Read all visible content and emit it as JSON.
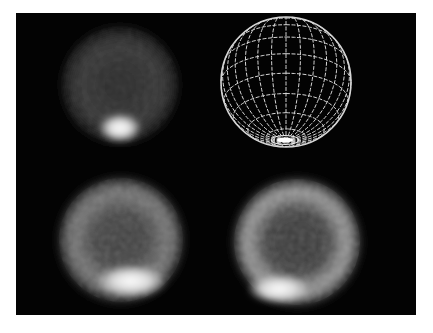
{
  "figure": {
    "background": "#ffffff",
    "panel_background": "#030303",
    "panels": [
      {
        "id": "top-left",
        "kind": "scintigraphic-sphere",
        "cx": 104,
        "cy": 72,
        "r": 58,
        "base_gray": "#3a3a3a",
        "hotspot": {
          "cx": 104,
          "cy": 115,
          "rx": 20,
          "ry": 14,
          "color": "#f4f4f4"
        }
      },
      {
        "id": "top-right",
        "kind": "wireframe-sphere",
        "cx": 270,
        "cy": 69,
        "r": 65,
        "meridians": 14,
        "parallels": 9,
        "line_color": "#d8d8d8",
        "pole_highlight": {
          "cx": 269,
          "cy": 127,
          "rx": 14,
          "ry": 4
        }
      },
      {
        "id": "bottom-left",
        "kind": "scintigraphic-sphere",
        "cx": 105,
        "cy": 227,
        "r": 62,
        "base_gray": "#555555",
        "ring_gray": "#8a8a8a",
        "hotspot": {
          "cx": 115,
          "cy": 268,
          "rx": 34,
          "ry": 16,
          "color": "#f0f0f0"
        }
      },
      {
        "id": "bottom-right",
        "kind": "scintigraphic-sphere",
        "cx": 281,
        "cy": 229,
        "r": 63,
        "base_gray": "#4a4a4a",
        "ring_gray": "#a8a8a8",
        "hotspot": {
          "cx": 263,
          "cy": 276,
          "rx": 30,
          "ry": 14,
          "color": "#f2f2f2"
        }
      }
    ]
  }
}
